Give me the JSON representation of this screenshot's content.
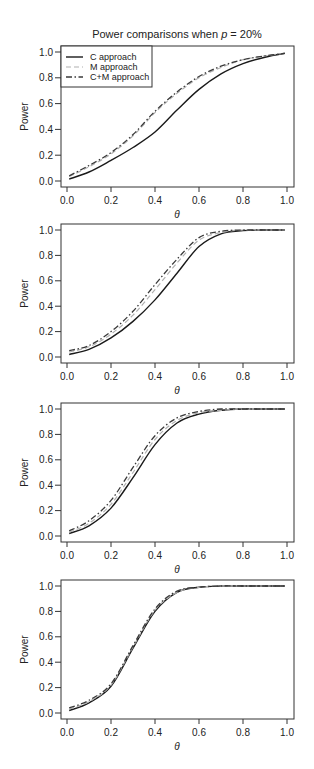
{
  "figure": {
    "title_prefix": "Power comparisons when ",
    "title_var": "p",
    "title_suffix": " = 20%"
  },
  "legend": [
    {
      "label": "C approach",
      "style": "solid",
      "color": "#1a1a1a"
    },
    {
      "label": "M approach",
      "style": "dashed",
      "color": "#b0b0b0"
    },
    {
      "label": "C+M approach",
      "style": "dashdot",
      "color": "#3a3a3a"
    }
  ],
  "chart_data": [
    {
      "type": "line",
      "title": "Power comparisons when p=20%",
      "xlabel": "θ",
      "ylabel": "Power",
      "xlim": [
        0.0,
        1.0
      ],
      "ylim": [
        0.0,
        1.0
      ],
      "xticks": [
        "0.0",
        "0.2",
        "0.4",
        "0.6",
        "0.8",
        "1.0"
      ],
      "yticks": [
        "0.0",
        "0.2",
        "0.4",
        "0.6",
        "0.8",
        "1.0"
      ],
      "grid": false,
      "legend_position": "top-left",
      "x": [
        0.01,
        0.1,
        0.2,
        0.3,
        0.4,
        0.5,
        0.6,
        0.7,
        0.8,
        0.9,
        0.99
      ],
      "series": [
        {
          "name": "C approach",
          "values": [
            0.015,
            0.07,
            0.16,
            0.26,
            0.38,
            0.55,
            0.71,
            0.83,
            0.91,
            0.96,
            0.99
          ]
        },
        {
          "name": "M approach",
          "values": [
            0.035,
            0.11,
            0.21,
            0.35,
            0.53,
            0.68,
            0.8,
            0.88,
            0.94,
            0.97,
            0.99
          ]
        },
        {
          "name": "C+M approach",
          "values": [
            0.04,
            0.12,
            0.22,
            0.36,
            0.54,
            0.69,
            0.81,
            0.89,
            0.94,
            0.97,
            0.99
          ]
        }
      ]
    },
    {
      "type": "line",
      "xlabel": "θ",
      "ylabel": "Power",
      "xlim": [
        0.0,
        1.0
      ],
      "ylim": [
        0.0,
        1.0
      ],
      "xticks": [
        "0.0",
        "0.2",
        "0.4",
        "0.6",
        "0.8",
        "1.0"
      ],
      "yticks": [
        "0.0",
        "0.2",
        "0.4",
        "0.6",
        "0.8",
        "1.0"
      ],
      "grid": false,
      "x": [
        0.01,
        0.1,
        0.2,
        0.3,
        0.4,
        0.5,
        0.6,
        0.7,
        0.8,
        0.9,
        0.99
      ],
      "series": [
        {
          "name": "C approach",
          "values": [
            0.02,
            0.06,
            0.15,
            0.28,
            0.45,
            0.66,
            0.87,
            0.97,
            0.995,
            1.0,
            1.0
          ]
        },
        {
          "name": "M approach",
          "values": [
            0.04,
            0.08,
            0.18,
            0.33,
            0.53,
            0.74,
            0.92,
            0.98,
            1.0,
            1.0,
            1.0
          ]
        },
        {
          "name": "C+M approach",
          "values": [
            0.05,
            0.09,
            0.2,
            0.36,
            0.57,
            0.77,
            0.94,
            0.99,
            1.0,
            1.0,
            1.0
          ]
        }
      ]
    },
    {
      "type": "line",
      "xlabel": "θ",
      "ylabel": "Power",
      "xlim": [
        0.0,
        1.0
      ],
      "ylim": [
        0.0,
        1.0
      ],
      "xticks": [
        "0.0",
        "0.2",
        "0.4",
        "0.6",
        "0.8",
        "1.0"
      ],
      "yticks": [
        "0.0",
        "0.2",
        "0.4",
        "0.6",
        "0.8",
        "1.0"
      ],
      "grid": false,
      "x": [
        0.01,
        0.1,
        0.2,
        0.3,
        0.4,
        0.5,
        0.6,
        0.7,
        0.8,
        0.9,
        0.99
      ],
      "series": [
        {
          "name": "C approach",
          "values": [
            0.02,
            0.08,
            0.22,
            0.46,
            0.72,
            0.89,
            0.96,
            0.99,
            1.0,
            1.0,
            1.0
          ]
        },
        {
          "name": "M approach",
          "values": [
            0.03,
            0.1,
            0.25,
            0.5,
            0.76,
            0.91,
            0.97,
            0.99,
            1.0,
            1.0,
            1.0
          ]
        },
        {
          "name": "C+M approach",
          "values": [
            0.04,
            0.12,
            0.28,
            0.54,
            0.79,
            0.93,
            0.98,
            1.0,
            1.0,
            1.0,
            1.0
          ]
        }
      ]
    },
    {
      "type": "line",
      "xlabel": "θ",
      "ylabel": "Power",
      "xlim": [
        0.0,
        1.0
      ],
      "ylim": [
        0.0,
        1.0
      ],
      "xticks": [
        "0.0",
        "0.2",
        "0.4",
        "0.6",
        "0.8",
        "1.0"
      ],
      "yticks": [
        "0.0",
        "0.2",
        "0.4",
        "0.6",
        "0.8",
        "1.0"
      ],
      "grid": false,
      "x": [
        0.01,
        0.1,
        0.2,
        0.3,
        0.4,
        0.5,
        0.6,
        0.7,
        0.8,
        0.9,
        0.99
      ],
      "series": [
        {
          "name": "C approach",
          "values": [
            0.02,
            0.08,
            0.21,
            0.51,
            0.8,
            0.95,
            0.99,
            1.0,
            1.0,
            1.0,
            1.0
          ]
        },
        {
          "name": "M approach",
          "values": [
            0.03,
            0.09,
            0.22,
            0.52,
            0.81,
            0.95,
            0.99,
            1.0,
            1.0,
            1.0,
            1.0
          ]
        },
        {
          "name": "C+M approach",
          "values": [
            0.04,
            0.1,
            0.23,
            0.53,
            0.82,
            0.96,
            0.99,
            1.0,
            1.0,
            1.0,
            1.0
          ]
        }
      ]
    }
  ]
}
